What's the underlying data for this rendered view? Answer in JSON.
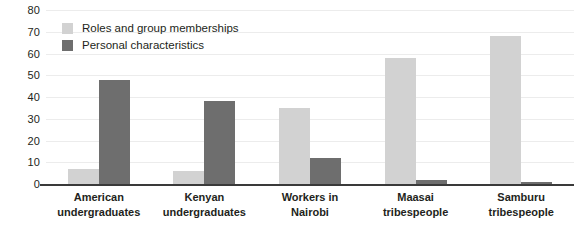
{
  "chart_data": {
    "type": "bar",
    "title": "",
    "subtitle": "",
    "xlabel": "",
    "ylabel": "",
    "ylim": [
      0,
      80
    ],
    "ytick_step": 10,
    "yticks": [
      80,
      70,
      60,
      50,
      40,
      30,
      20,
      10,
      0
    ],
    "grid": true,
    "legend_position": "top-left inside plot",
    "categories": [
      [
        "American",
        "undergraduates"
      ],
      [
        "Kenyan",
        "undergraduates"
      ],
      [
        "Workers in",
        "Nairobi"
      ],
      [
        "Maasai",
        "tribespeople"
      ],
      [
        "Samburu",
        "tribespeople"
      ]
    ],
    "category_labels": [
      "American undergraduates",
      "Kenyan undergraduates",
      "Workers in Nairobi",
      "Maasai tribespeople",
      "Samburu tribespeople"
    ],
    "series": [
      {
        "name": "Roles and group memberships",
        "color": "#d2d2d2",
        "values": [
          7,
          6,
          35,
          58,
          68
        ]
      },
      {
        "name": "Personal characteristics",
        "color": "#6e6e6e",
        "values": [
          48,
          38,
          12,
          2,
          1
        ]
      }
    ]
  },
  "legend": {
    "items": [
      {
        "label": "Roles and group memberships",
        "swatch": "light"
      },
      {
        "label": "Personal characteristics",
        "swatch": "dark"
      }
    ]
  },
  "colors": {
    "series_light": "#d2d2d2",
    "series_dark": "#6e6e6e",
    "gridline": "#ececec",
    "axis": "#3a3a3a",
    "text": "#231f20",
    "background": "#ffffff"
  }
}
